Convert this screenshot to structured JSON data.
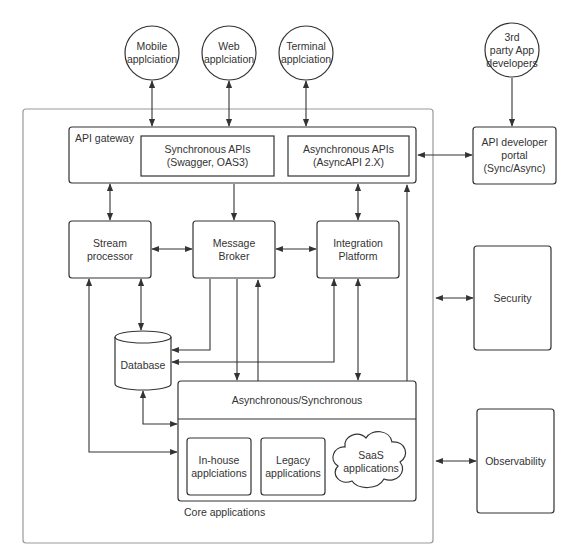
{
  "diagram": {
    "external_clients": [
      {
        "id": "mobile",
        "label": "Mobile\napplciation"
      },
      {
        "id": "web",
        "label": "Web\napplciation"
      },
      {
        "id": "terminal",
        "label": "Terminal\napplciation"
      },
      {
        "id": "third_party",
        "label": "3rd\nparty App\ndevelopers"
      }
    ],
    "api_gateway": {
      "label": "API gateway",
      "sync_apis": "Synchronous APIs\n(Swagger, OAS3)",
      "async_apis": "Asynchronous APIs\n(AsyncAPI 2.X)"
    },
    "api_developer_portal": "API developer\nportal\n(Sync/Async)",
    "stream_processor": "Stream\nprocessor",
    "message_broker": "Message\nBroker",
    "integration_platform": "Integration\nPlatform",
    "database": "Database",
    "async_sync_layer": "Asynchronous/Synchronous",
    "core_applications": {
      "label": "Core applications",
      "in_house": "In-house\napplciations",
      "legacy": "Legacy\napplications",
      "saas": "SaaS\napplications"
    },
    "security": "Security",
    "observability": "Observability"
  }
}
